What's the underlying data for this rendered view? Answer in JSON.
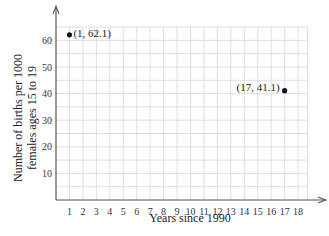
{
  "chart_data": {
    "type": "scatter",
    "title": "",
    "xlabel": "Years since 1990",
    "ylabel_line1": "Number of births per 1000",
    "ylabel_line2": "females ages 15 to 19",
    "xlim": [
      0,
      19
    ],
    "ylim": [
      0,
      65
    ],
    "x_ticks": [
      1,
      2,
      3,
      4,
      5,
      6,
      7,
      8,
      9,
      10,
      11,
      12,
      13,
      14,
      15,
      16,
      17,
      18
    ],
    "y_ticks": [
      10,
      20,
      30,
      40,
      50,
      60
    ],
    "grid": true,
    "grid_x_step": 1,
    "grid_y_step": 5,
    "points": [
      {
        "x": 1,
        "y": 62.1,
        "label": "(1, 62.1)",
        "label_side": "right"
      },
      {
        "x": 17,
        "y": 41.1,
        "label": "(17, 41.1)",
        "label_side": "left"
      }
    ],
    "colors": {
      "axis": "#555555",
      "grid": "#d8d8d8",
      "point": "#111111"
    }
  }
}
